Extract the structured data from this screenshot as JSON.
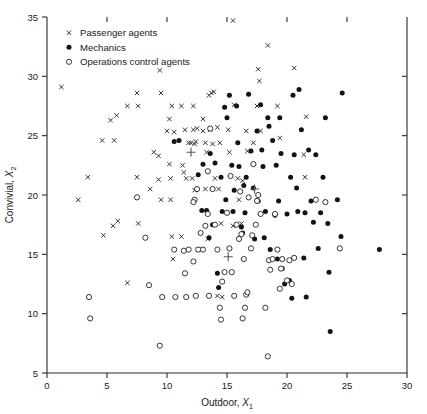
{
  "chart_data": {
    "type": "scatter",
    "title": "",
    "xlabel": "Outdoor, X1",
    "xlabel_main": "Outdoor,",
    "xlabel_var": "X",
    "xlabel_sub": "1",
    "ylabel": "Convivial, X2",
    "ylabel_main": "Convivial,",
    "ylabel_var": "X",
    "ylabel_sub": "2",
    "xlim": [
      0,
      30
    ],
    "ylim": [
      5,
      35
    ],
    "xticks": [
      0,
      5,
      10,
      15,
      20,
      25,
      30
    ],
    "yticks": [
      5,
      10,
      15,
      20,
      25,
      30,
      35
    ],
    "grid": false,
    "legend_position": "top-left",
    "legend": [
      {
        "label": "Passenger agents",
        "marker": "cross",
        "color": "#2b2b2b"
      },
      {
        "label": "Mechanics",
        "marker": "filled-circle",
        "color": "#121212"
      },
      {
        "label": "Operations control agents",
        "marker": "open-circle",
        "color": "#2b2b2b"
      }
    ],
    "series": [
      {
        "name": "Passenger agents",
        "marker": "cross",
        "points": [
          [
            1.2,
            29.1
          ],
          [
            2.6,
            19.6
          ],
          [
            3.4,
            21.5
          ],
          [
            4.6,
            24.6
          ],
          [
            5.6,
            24.6
          ],
          [
            5.3,
            26.3
          ],
          [
            5.8,
            26.7
          ],
          [
            6.7,
            27.5
          ],
          [
            7.6,
            27.5
          ],
          [
            7.5,
            28.6
          ],
          [
            6.7,
            12.6
          ],
          [
            5.5,
            17.4
          ],
          [
            5.9,
            17.8
          ],
          [
            4.7,
            16.6
          ],
          [
            7.5,
            21.5
          ],
          [
            7.6,
            17.6
          ],
          [
            9.3,
            23.3
          ],
          [
            8.9,
            23.6
          ],
          [
            8.6,
            20.5
          ],
          [
            9.5,
            19.6
          ],
          [
            9.3,
            21.3
          ],
          [
            9.5,
            28.6
          ],
          [
            9.4,
            30.5
          ],
          [
            10.3,
            19.6
          ],
          [
            10.3,
            21.4
          ],
          [
            10.2,
            26.4
          ],
          [
            10.0,
            25.4
          ],
          [
            10.4,
            27.5
          ],
          [
            10.2,
            22.6
          ],
          [
            10.4,
            16.5
          ],
          [
            11.2,
            16.5
          ],
          [
            10.5,
            14.6
          ],
          [
            10.6,
            25.3
          ],
          [
            11.2,
            27.5
          ],
          [
            11.5,
            25.5
          ],
          [
            11.3,
            22.5
          ],
          [
            11.4,
            21.9
          ],
          [
            11.6,
            21.4
          ],
          [
            12.2,
            27.5
          ],
          [
            12.2,
            25.5
          ],
          [
            12.4,
            24.5
          ],
          [
            12.3,
            24.3
          ],
          [
            12.0,
            24.4
          ],
          [
            11.8,
            24.4
          ],
          [
            12.1,
            21.4
          ],
          [
            12.3,
            20.4
          ],
          [
            12.6,
            15.4
          ],
          [
            12.5,
            25.6
          ],
          [
            13.0,
            26.4
          ],
          [
            13.2,
            24.4
          ],
          [
            13.0,
            25.4
          ],
          [
            13.3,
            23.6
          ],
          [
            13.2,
            20.5
          ],
          [
            13.4,
            16.3
          ],
          [
            13.5,
            28.4
          ],
          [
            13.7,
            28.6
          ],
          [
            13.9,
            28.7
          ],
          [
            13.6,
            25.5
          ],
          [
            13.8,
            24.3
          ],
          [
            14.0,
            21.4
          ],
          [
            14.2,
            25.7
          ],
          [
            14.4,
            24.4
          ],
          [
            14.3,
            20.5
          ],
          [
            14.5,
            17.6
          ],
          [
            14.2,
            11.5
          ],
          [
            14.6,
            11.4
          ],
          [
            15.2,
            23.6
          ],
          [
            15.1,
            25.5
          ],
          [
            15.5,
            34.7
          ],
          [
            15.6,
            27.6
          ],
          [
            15.9,
            21.4
          ],
          [
            16.0,
            19.6
          ],
          [
            16.3,
            21.2
          ],
          [
            16.6,
            25.4
          ],
          [
            16.7,
            23.7
          ],
          [
            17.2,
            24.4
          ],
          [
            17.5,
            27.5
          ],
          [
            17.6,
            30.6
          ],
          [
            17.7,
            29.6
          ],
          [
            17.8,
            25.4
          ],
          [
            18.4,
            32.6
          ],
          [
            19.2,
            27.5
          ],
          [
            19.4,
            24.8
          ],
          [
            20.6,
            30.7
          ],
          [
            21.4,
            23.4
          ],
          [
            21.5,
            21.5
          ],
          [
            21.6,
            26.6
          ],
          [
            16.2,
            17.6
          ],
          [
            15.5,
            17.4
          ]
        ]
      },
      {
        "name": "Mechanics",
        "marker": "filled-circle",
        "points": [
          [
            10.6,
            24.5
          ],
          [
            11.0,
            24.6
          ],
          [
            12.6,
            21.7
          ],
          [
            13.0,
            22.6
          ],
          [
            13.3,
            18.7
          ],
          [
            13.5,
            16.4
          ],
          [
            13.6,
            23.5
          ],
          [
            14.0,
            22.7
          ],
          [
            14.2,
            13.4
          ],
          [
            14.3,
            12.2
          ],
          [
            14.5,
            21.5
          ],
          [
            14.6,
            18.6
          ],
          [
            14.8,
            27.4
          ],
          [
            15.0,
            26.5
          ],
          [
            15.2,
            28.4
          ],
          [
            15.4,
            22.5
          ],
          [
            15.5,
            18.6
          ],
          [
            15.6,
            20.4
          ],
          [
            15.8,
            27.5
          ],
          [
            16.0,
            22.4
          ],
          [
            16.2,
            17.3
          ],
          [
            16.3,
            16.8
          ],
          [
            16.5,
            18.5
          ],
          [
            16.6,
            21.5
          ],
          [
            16.8,
            28.5
          ],
          [
            17.0,
            23.7
          ],
          [
            17.2,
            20.6
          ],
          [
            17.3,
            16.3
          ],
          [
            17.5,
            25.4
          ],
          [
            17.6,
            19.5
          ],
          [
            17.8,
            27.6
          ],
          [
            18.0,
            22.4
          ],
          [
            18.2,
            18.6
          ],
          [
            18.4,
            26.5
          ],
          [
            18.5,
            25.8
          ],
          [
            18.6,
            15.4
          ],
          [
            18.8,
            24.6
          ],
          [
            19.0,
            18.3
          ],
          [
            19.2,
            14.6
          ],
          [
            19.3,
            19.5
          ],
          [
            19.4,
            26.5
          ],
          [
            19.5,
            23.5
          ],
          [
            19.6,
            13.8
          ],
          [
            19.8,
            12.5
          ],
          [
            20.0,
            18.4
          ],
          [
            20.2,
            12.8
          ],
          [
            20.3,
            21.5
          ],
          [
            20.4,
            11.3
          ],
          [
            20.5,
            28.4
          ],
          [
            20.6,
            23.4
          ],
          [
            20.8,
            20.6
          ],
          [
            21.0,
            28.9
          ],
          [
            21.2,
            25.5
          ],
          [
            21.4,
            14.7
          ],
          [
            21.5,
            18.5
          ],
          [
            21.6,
            11.4
          ],
          [
            21.8,
            23.8
          ],
          [
            22.0,
            19.5
          ],
          [
            22.2,
            17.7
          ],
          [
            22.4,
            23.4
          ],
          [
            22.6,
            15.5
          ],
          [
            23.0,
            21.5
          ],
          [
            23.2,
            26.5
          ],
          [
            23.4,
            17.6
          ],
          [
            23.5,
            13.5
          ],
          [
            23.6,
            8.5
          ],
          [
            24.2,
            19.6
          ],
          [
            24.6,
            28.6
          ],
          [
            24.5,
            16.5
          ],
          [
            27.7,
            15.4
          ],
          [
            16.4,
            20.8
          ],
          [
            17.9,
            23.8
          ],
          [
            19.1,
            22.5
          ],
          [
            15.9,
            24.4
          ],
          [
            14.9,
            19.6
          ],
          [
            12.9,
            18.7
          ],
          [
            13.8,
            17.5
          ],
          [
            18.1,
            16.4
          ],
          [
            20.9,
            18.6
          ],
          [
            22.8,
            18.5
          ]
        ]
      },
      {
        "name": "Operations control agents",
        "marker": "open-circle",
        "points": [
          [
            3.5,
            11.4
          ],
          [
            3.6,
            9.6
          ],
          [
            7.5,
            19.8
          ],
          [
            8.5,
            12.4
          ],
          [
            8.2,
            16.4
          ],
          [
            9.4,
            7.3
          ],
          [
            9.6,
            11.4
          ],
          [
            10.6,
            15.4
          ],
          [
            10.7,
            11.4
          ],
          [
            11.4,
            15.3
          ],
          [
            11.6,
            11.4
          ],
          [
            11.5,
            13.4
          ],
          [
            12.2,
            14.4
          ],
          [
            12.4,
            11.5
          ],
          [
            12.6,
            15.4
          ],
          [
            12.5,
            20.5
          ],
          [
            12.3,
            19.6
          ],
          [
            12.2,
            19.4
          ],
          [
            13.0,
            15.4
          ],
          [
            13.2,
            17.4
          ],
          [
            13.4,
            22.0
          ],
          [
            13.4,
            18.4
          ],
          [
            13.5,
            11.5
          ],
          [
            13.6,
            25.6
          ],
          [
            13.8,
            20.5
          ],
          [
            14.0,
            17.5
          ],
          [
            14.2,
            15.4
          ],
          [
            14.4,
            10.5
          ],
          [
            14.5,
            9.5
          ],
          [
            14.6,
            12.7
          ],
          [
            14.8,
            13.5
          ],
          [
            15.0,
            18.5
          ],
          [
            15.2,
            15.5
          ],
          [
            15.4,
            13.5
          ],
          [
            15.6,
            11.5
          ],
          [
            15.8,
            17.5
          ],
          [
            16.0,
            16.3
          ],
          [
            16.2,
            16.7
          ],
          [
            16.4,
            14.6
          ],
          [
            16.3,
            9.6
          ],
          [
            16.5,
            10.5
          ],
          [
            16.6,
            11.6
          ],
          [
            16.7,
            11.8
          ],
          [
            16.8,
            19.8
          ],
          [
            17.0,
            15.5
          ],
          [
            17.2,
            22.6
          ],
          [
            17.4,
            17.5
          ],
          [
            17.5,
            19.5
          ],
          [
            17.6,
            20.0
          ],
          [
            17.8,
            18.4
          ],
          [
            18.2,
            10.5
          ],
          [
            18.4,
            6.4
          ],
          [
            18.5,
            14.5
          ],
          [
            18.6,
            13.7
          ],
          [
            18.8,
            14.6
          ],
          [
            19.0,
            18.4
          ],
          [
            19.2,
            15.4
          ],
          [
            19.4,
            12.1
          ],
          [
            19.5,
            13.8
          ],
          [
            19.6,
            14.6
          ],
          [
            20.0,
            12.8
          ],
          [
            20.2,
            14.5
          ],
          [
            20.4,
            12.5
          ],
          [
            20.6,
            14.7
          ],
          [
            22.4,
            19.6
          ],
          [
            23.2,
            19.4
          ],
          [
            24.4,
            15.5
          ],
          [
            16.1,
            20.3
          ],
          [
            15.3,
            21.6
          ],
          [
            12.8,
            16.8
          ],
          [
            11.8,
            15.4
          ],
          [
            17.1,
            16.6
          ]
        ]
      },
      {
        "name": "Group centroids",
        "marker": "plus",
        "points": [
          [
            12.0,
            23.6
          ],
          [
            17.3,
            20.5
          ],
          [
            15.1,
            14.8
          ]
        ]
      }
    ]
  }
}
